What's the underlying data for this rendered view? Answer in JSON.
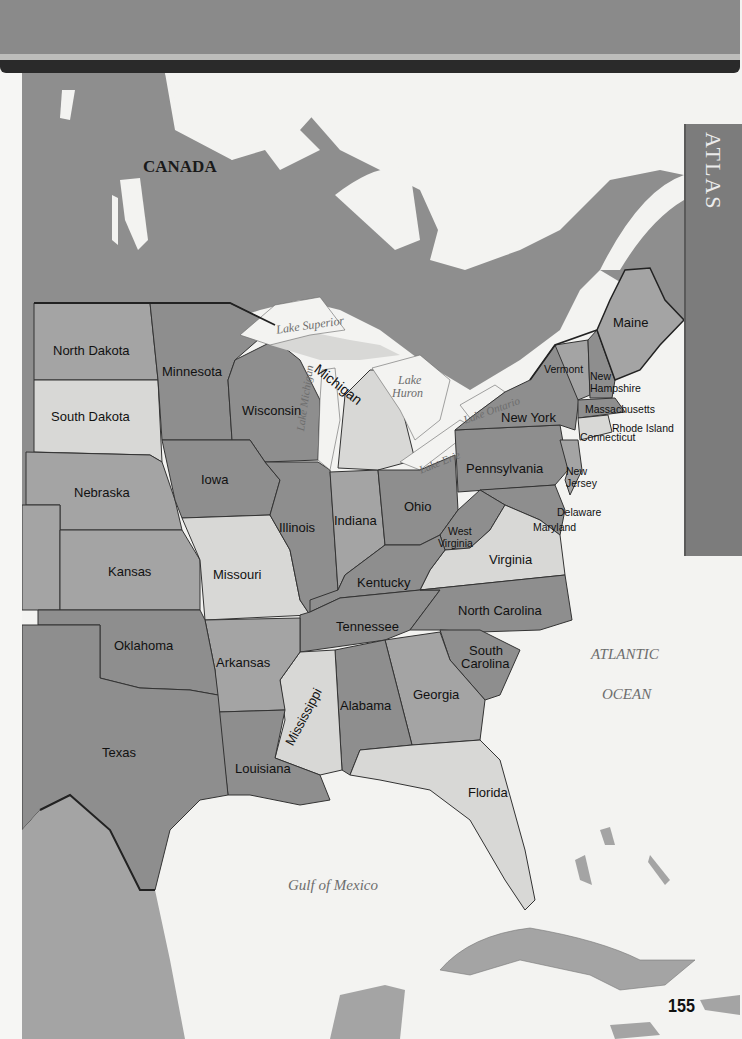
{
  "page": {
    "section_tab": "ATLAS",
    "page_number": "155"
  },
  "colors": {
    "land_dark": "#8e8e8e",
    "land_medium": "#a4a4a4",
    "land_light": "#d8d8d6",
    "water": "#f3f3f1",
    "top_band": "#8a8a8a",
    "dark_bar": "#2a2a2a",
    "atlas_tab": "#7c7c7c"
  },
  "map": {
    "country_label": "CANADA",
    "water_labels": {
      "lake_superior": "Lake Superior",
      "lake_michigan": "Lake Michigan",
      "lake_huron_1": "Lake",
      "lake_huron_2": "Huron",
      "lake_erie": "Lake Erie",
      "lake_ontario": "Lake Ontario",
      "atlantic_1": "ATLANTIC",
      "atlantic_2": "OCEAN",
      "gulf": "Gulf of Mexico"
    },
    "states": {
      "north_dakota": "North Dakota",
      "south_dakota": "South Dakota",
      "minnesota": "Minnesota",
      "wisconsin": "Wisconsin",
      "michigan": "Michigan",
      "iowa": "Iowa",
      "nebraska": "Nebraska",
      "kansas": "Kansas",
      "missouri": "Missouri",
      "illinois": "Illinois",
      "indiana": "Indiana",
      "ohio": "Ohio",
      "kentucky": "Kentucky",
      "tennessee": "Tennessee",
      "oklahoma": "Oklahoma",
      "arkansas": "Arkansas",
      "texas": "Texas",
      "louisiana": "Louisiana",
      "mississippi": "Mississippi",
      "alabama": "Alabama",
      "georgia": "Georgia",
      "florida": "Florida",
      "south_carolina_1": "South",
      "south_carolina_2": "Carolina",
      "north_carolina": "North Carolina",
      "virginia": "Virginia",
      "west_virginia_1": "West",
      "west_virginia_2": "Virginia",
      "maryland": "Maryland",
      "delaware": "Delaware",
      "new_jersey_1": "New",
      "new_jersey_2": "Jersey",
      "pennsylvania": "Pennsylvania",
      "new_york": "New York",
      "vermont": "Vermont",
      "new_hampshire_1": "New",
      "new_hampshire_2": "Hampshire",
      "maine": "Maine",
      "massachusetts": "Massachusetts",
      "rhode_island": "Rhode Island",
      "connecticut": "Connecticut"
    }
  }
}
